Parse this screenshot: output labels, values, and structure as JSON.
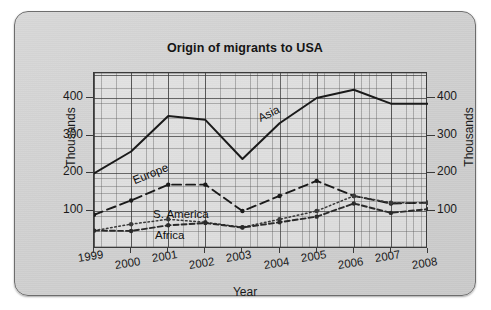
{
  "chart_data": {
    "type": "line",
    "title": "Origin of migrants to USA",
    "xlabel": "Year",
    "ylabel": "Thousands",
    "ylabel_right": "Thousands",
    "categories": [
      "1999",
      "2000",
      "2001",
      "2002",
      "2003",
      "2004",
      "2005",
      "2006",
      "2007",
      "2008"
    ],
    "x": [
      1999,
      2000,
      2001,
      2002,
      2003,
      2004,
      2005,
      2006,
      2007,
      2008
    ],
    "ylim": [
      0,
      470
    ],
    "yticks": [
      100,
      200,
      300,
      400
    ],
    "ytick_labels": [
      "100",
      "200",
      "300",
      "400"
    ],
    "ytick_labels_right": [
      "100",
      "200",
      "300",
      "400"
    ],
    "grid": true,
    "grid_minor": true,
    "legend": "inline-labels",
    "series": [
      {
        "name": "Asia",
        "style": "solid",
        "color": "#1a1a1a",
        "markers": false,
        "values": [
          200,
          258,
          352,
          342,
          238,
          333,
          400,
          422,
          385,
          385
        ]
      },
      {
        "name": "Europe",
        "style": "dashed",
        "color": "#1a1a1a",
        "markers": true,
        "values": [
          90,
          128,
          170,
          170,
          100,
          140,
          180,
          140,
          120,
          122
        ]
      },
      {
        "name": "S. America",
        "style": "dotted",
        "color": "#3a3a3a",
        "markers": true,
        "values": [
          48,
          65,
          78,
          70,
          57,
          78,
          100,
          140,
          122,
          122
        ]
      },
      {
        "name": "Africa",
        "style": "dash-dot",
        "color": "#2a2a2a",
        "markers": true,
        "values": [
          48,
          47,
          62,
          68,
          56,
          70,
          85,
          120,
          95,
          105
        ]
      }
    ],
    "annotations": [
      {
        "text": "Asia",
        "series": "Asia"
      },
      {
        "text": "Europe",
        "series": "Europe"
      },
      {
        "text": "S. America",
        "series": "S. America"
      },
      {
        "text": "Africa",
        "series": "Africa"
      }
    ]
  }
}
